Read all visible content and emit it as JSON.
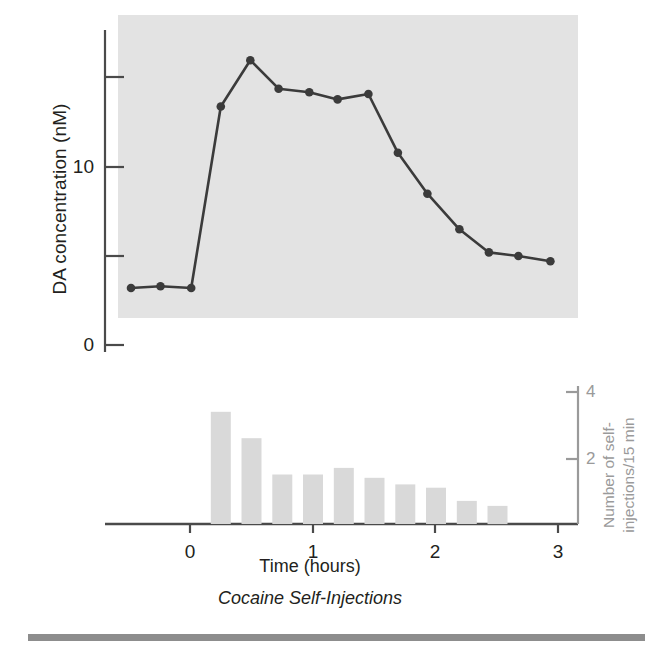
{
  "figure": {
    "caption": "Cocaine Self-Injections",
    "xaxis_title": "Time (hours)",
    "yaxis_left_label": "DA concentration (nM)",
    "yaxis_right_label_line1": "Number of self-",
    "yaxis_right_label_line2": "injections/15 min",
    "colors": {
      "line": "#3b3b3b",
      "marker": "#3b3b3b",
      "plot_background": "#e3e3e3",
      "bar": "#d9d9d9",
      "right_axis": "#9a9a9a",
      "rule": "#8d8d8d",
      "text": "#231f20"
    }
  },
  "chart_data": [
    {
      "type": "line",
      "name": "DA concentration time course",
      "title": "Cocaine Self-Injections",
      "xlabel": "Time (hours)",
      "ylabel": "DA concentration (nM)",
      "xlim": [
        -0.55,
        3.0
      ],
      "ylim": [
        0,
        17.2
      ],
      "xticks": [
        0,
        1,
        2,
        3
      ],
      "xticklabels": [
        "0",
        "1",
        "2",
        "3"
      ],
      "yticks": [
        0,
        5,
        10,
        15
      ],
      "yticklabels": [
        "0",
        "",
        "10",
        ""
      ],
      "grid": false,
      "legend": "none",
      "marker": "filled-circle",
      "x": [
        -0.48,
        -0.24,
        0.01,
        0.25,
        0.49,
        0.72,
        0.97,
        1.2,
        1.45,
        1.69,
        1.93,
        2.19,
        2.43,
        2.67,
        2.93
      ],
      "y": [
        3.2,
        3.3,
        3.2,
        13.4,
        16.0,
        14.4,
        14.2,
        13.8,
        14.1,
        10.8,
        8.5,
        6.5,
        5.2,
        5.0,
        4.7
      ]
    },
    {
      "type": "bar",
      "name": "Cocaine self-injections per 15 min",
      "ylabel": "Number of self-injections/15 min",
      "xlabel": "Time (hours)",
      "ylim": [
        0,
        4.6
      ],
      "yticks": [
        2,
        4
      ],
      "yticklabels": [
        "2",
        "4"
      ],
      "grid": false,
      "legend": "none",
      "bin_width_hours": 0.25,
      "categories": [
        "0.25",
        "0.50",
        "0.75",
        "1.00",
        "1.25",
        "1.50",
        "1.75",
        "2.00",
        "2.25",
        "2.50"
      ],
      "values": [
        3.4,
        2.6,
        1.5,
        1.5,
        1.7,
        1.4,
        1.2,
        1.1,
        0.7,
        0.55
      ]
    }
  ],
  "axes": {
    "left_ticks": [
      {
        "label": "",
        "value": 15
      },
      {
        "label": "10",
        "value": 10
      },
      {
        "label": "",
        "value": 5
      },
      {
        "label": "0",
        "value": 0
      }
    ],
    "right_ticks": [
      {
        "label": "4",
        "value": 4
      },
      {
        "label": "2",
        "value": 2
      }
    ],
    "x_ticks": [
      {
        "label": "0",
        "value": 0
      },
      {
        "label": "1",
        "value": 1
      },
      {
        "label": "2",
        "value": 2
      },
      {
        "label": "3",
        "value": 3
      }
    ]
  }
}
